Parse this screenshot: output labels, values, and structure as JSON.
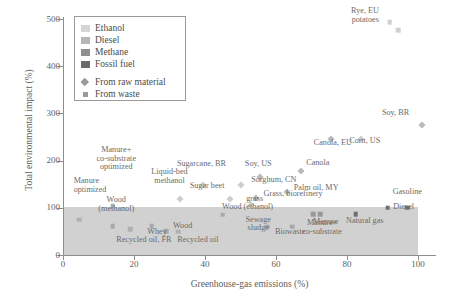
{
  "chart_data": {
    "type": "scatter",
    "title": "",
    "xlabel": "Greenhouse-gas emissions (%)",
    "ylabel": "Total environmental impact (%)",
    "xlim": [
      0,
      105
    ],
    "ylim": [
      0,
      500
    ],
    "xticks": [
      "0",
      "20",
      "40",
      "60",
      "80",
      "100"
    ],
    "yticks": [
      "0",
      "100",
      "200",
      "300",
      "400",
      "500"
    ],
    "grid": false,
    "legend_position": "top-left",
    "legend": {
      "categories": [
        {
          "label": "Ethanol",
          "color": "#d5d5d5"
        },
        {
          "label": "Diesel",
          "color": "#b5b5b5"
        },
        {
          "label": "Methane",
          "color": "#8f8f8f"
        },
        {
          "label": "Fossil fuel",
          "color": "#6b6b6b"
        }
      ],
      "markers": [
        {
          "label": "From raw material",
          "shape": "diamond"
        },
        {
          "label": "From waste",
          "shape": "square"
        }
      ]
    },
    "shaded_band": {
      "x_from": 0,
      "x_to": 100,
      "y_from": 0,
      "y_to": 102,
      "color": "#c9c9c9"
    },
    "points": [
      {
        "label": "Rye, EU",
        "x": 92.0,
        "y": 493,
        "shape": "square",
        "color": "#cfcfcf",
        "lx": 89.0,
        "ly": 489,
        "anchor": "r",
        "lines": [
          "Rye, EU",
          "potatoes"
        ]
      },
      {
        "label": "potatoes",
        "x": 94.5,
        "y": 476,
        "shape": "square",
        "color": "#cfcfcf",
        "anchor": "none"
      },
      {
        "label": "Soy, BR",
        "x": 101.0,
        "y": 276,
        "shape": "diamond",
        "color": "#b9b9b9",
        "lx": 97.5,
        "ly": 292,
        "anchor": "r"
      },
      {
        "label": "Corn, US",
        "x": 84.0,
        "y": 245,
        "shape": "diamond",
        "color": "#cdcdcd",
        "lx": 85.0,
        "ly": 231,
        "anchor": "c"
      },
      {
        "label": "Canola, EU",
        "x": 75.5,
        "y": 246,
        "shape": "diamond",
        "color": "#b9b9b9",
        "lx": 76.0,
        "ly": 228,
        "anchor": "c"
      },
      {
        "label": "Canola",
        "x": 67.0,
        "y": 177,
        "shape": "diamond",
        "color": "#b9b9b9",
        "lx": 68.5,
        "ly": 186,
        "anchor": "l"
      },
      {
        "label": "Soy, US",
        "x": 55.5,
        "y": 166,
        "shape": "diamond",
        "color": "#b9b9b9",
        "lx": 55.0,
        "ly": 183,
        "anchor": "c"
      },
      {
        "label": "Sugarcane, BR",
        "x": 39.5,
        "y": 148,
        "shape": "diamond",
        "color": "#cdcdcd",
        "lx": 39.0,
        "ly": 182,
        "anchor": "c"
      },
      {
        "label": "Sorghum, CN",
        "x": 50.0,
        "y": 148,
        "shape": "diamond",
        "color": "#cdcdcd",
        "lx": 53.0,
        "ly": 150,
        "anchor": "l"
      },
      {
        "label": "Palm oil, MY",
        "x": 63.0,
        "y": 133,
        "shape": "diamond",
        "color": "#b9b9b9",
        "lx": 65.0,
        "ly": 133,
        "anchor": "l"
      },
      {
        "label": "Grass, biorefinery",
        "x": 54.5,
        "y": 120,
        "shape": "diamond",
        "color": "#b9b9b9",
        "lx": 56.5,
        "ly": 120,
        "anchor": "l"
      },
      {
        "label": "Sugar beet",
        "x": 47.0,
        "y": 119,
        "shape": "diamond",
        "color": "#cdcdcd",
        "lx": 45.5,
        "ly": 137,
        "anchor": "r"
      },
      {
        "label": "grass",
        "x": 53.0,
        "y": 106,
        "shape": "diamond",
        "color": "#cdcdcd",
        "lx": 54.0,
        "ly": 108,
        "anchor": "c"
      },
      {
        "label": "Liquid-bed methanol",
        "x": 33.0,
        "y": 118,
        "shape": "diamond",
        "color": "#cdcdcd",
        "lx": 30.0,
        "ly": 147,
        "anchor": "c",
        "lines": [
          "Liquid-bed",
          "methanol"
        ]
      },
      {
        "label": "Manure+ co-substrate optimized",
        "x": 14.0,
        "y": 104,
        "shape": "square",
        "color": "#b0b0b0",
        "lx": 15.0,
        "ly": 176,
        "anchor": "c",
        "lines": [
          "Manure+",
          "co-substrate",
          "optimized"
        ]
      },
      {
        "label": "Manure optimized",
        "x": 4.5,
        "y": 75,
        "shape": "square",
        "color": "#b0b0b0",
        "lx": 3.0,
        "ly": 128,
        "anchor": "l",
        "lines": [
          "Manure",
          "optimized"
        ]
      },
      {
        "label": "Wood (methanol)",
        "x": 14.0,
        "y": 61,
        "shape": "square",
        "color": "#a8a8a8",
        "lx": 15.0,
        "ly": 88,
        "anchor": "c",
        "lines": [
          "Wood",
          "(methanol)"
        ]
      },
      {
        "label": "Wood",
        "x": 29.0,
        "y": 50,
        "shape": "square",
        "color": "#a8a8a8",
        "lx": 31.0,
        "ly": 52,
        "anchor": "l"
      },
      {
        "label": "Whey",
        "x": 25.0,
        "y": 61,
        "shape": "square",
        "color": "#a8a8a8",
        "lx": 26.5,
        "ly": 40,
        "anchor": "c"
      },
      {
        "label": "Recycled oil, FR",
        "x": 19.0,
        "y": 55,
        "shape": "square",
        "color": "#b0b0b0",
        "lx": 15.0,
        "ly": 22,
        "anchor": "l"
      },
      {
        "label": "Recycled oil",
        "x": 32.5,
        "y": 49,
        "shape": "square",
        "color": "#b0b0b0",
        "lx": 38.0,
        "ly": 22,
        "anchor": "c"
      },
      {
        "label": "Wood (ethanol)",
        "x": 45.0,
        "y": 85,
        "shape": "square",
        "color": "#a8a8a8",
        "lx": 52.0,
        "ly": 92,
        "anchor": "c"
      },
      {
        "label": "Sewage sludge",
        "x": 57.5,
        "y": 60,
        "shape": "square",
        "color": "#a8a8a8",
        "lx": 55.0,
        "ly": 47,
        "anchor": "c",
        "lines": [
          "Sewage",
          "sludge"
        ]
      },
      {
        "label": "Biowaste",
        "x": 64.5,
        "y": 60,
        "shape": "square",
        "color": "#a8a8a8",
        "lx": 64.0,
        "ly": 40,
        "anchor": "c"
      },
      {
        "label": "Manure",
        "x": 70.5,
        "y": 86,
        "shape": "square",
        "color": "#989898",
        "lx": 74.0,
        "ly": 60,
        "anchor": "c"
      },
      {
        "label": "Manure+ co-substrate",
        "x": 72.5,
        "y": 86,
        "shape": "square",
        "color": "#989898",
        "lx": 73.0,
        "ly": 40,
        "anchor": "c",
        "lines": [
          "Manure+",
          "co-substrate"
        ]
      },
      {
        "label": "Natural gas",
        "x": 82.5,
        "y": 87,
        "shape": "square",
        "color": "#6f6f6f",
        "lx": 85.0,
        "ly": 63,
        "anchor": "c"
      },
      {
        "label": "Diesel",
        "x": 91.5,
        "y": 100,
        "shape": "square",
        "color": "#6f6f6f",
        "lx": 93.0,
        "ly": 91,
        "anchor": "l"
      },
      {
        "label": "Gasoline",
        "x": 97.0,
        "y": 100,
        "shape": "square",
        "color": "#6f6f6f",
        "lx": 97.0,
        "ly": 124,
        "anchor": "c"
      }
    ]
  }
}
